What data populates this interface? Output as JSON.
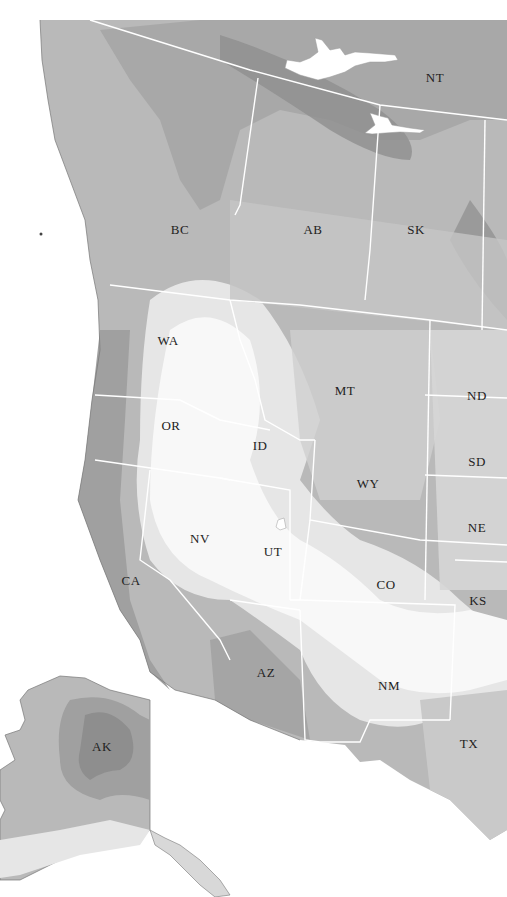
{
  "map": {
    "type": "choropleth-grayscale",
    "region": "Western North America",
    "colors": {
      "background": "#ffffff",
      "level_darkest": "#8e8e8e",
      "level_dark": "#a2a2a2",
      "level_mid": "#b9b9b9",
      "level_light": "#d2d2d2",
      "level_lighter": "#e6e6e6",
      "level_lightest": "#f7f7f7",
      "border": "#ffffff",
      "coast": "#777777"
    },
    "labels": [
      {
        "id": "NT",
        "text": "NT",
        "x": 435,
        "y": 78
      },
      {
        "id": "BC",
        "text": "BC",
        "x": 180,
        "y": 230
      },
      {
        "id": "AB",
        "text": "AB",
        "x": 313,
        "y": 230
      },
      {
        "id": "SK",
        "text": "SK",
        "x": 416,
        "y": 230
      },
      {
        "id": "WA",
        "text": "WA",
        "x": 168,
        "y": 341
      },
      {
        "id": "MT",
        "text": "MT",
        "x": 345,
        "y": 391
      },
      {
        "id": "ND",
        "text": "ND",
        "x": 477,
        "y": 396
      },
      {
        "id": "OR",
        "text": "OR",
        "x": 171,
        "y": 426
      },
      {
        "id": "ID",
        "text": "ID",
        "x": 260,
        "y": 446
      },
      {
        "id": "SD",
        "text": "SD",
        "x": 477,
        "y": 462
      },
      {
        "id": "WY",
        "text": "WY",
        "x": 368,
        "y": 484
      },
      {
        "id": "NE",
        "text": "NE",
        "x": 477,
        "y": 528
      },
      {
        "id": "NV",
        "text": "NV",
        "x": 200,
        "y": 539
      },
      {
        "id": "UT",
        "text": "UT",
        "x": 273,
        "y": 552
      },
      {
        "id": "CA",
        "text": "CA",
        "x": 131,
        "y": 581
      },
      {
        "id": "CO",
        "text": "CO",
        "x": 386,
        "y": 585
      },
      {
        "id": "KS",
        "text": "KS",
        "x": 478,
        "y": 601
      },
      {
        "id": "AZ",
        "text": "AZ",
        "x": 266,
        "y": 673
      },
      {
        "id": "NM",
        "text": "NM",
        "x": 389,
        "y": 686
      },
      {
        "id": "AK",
        "text": "AK",
        "x": 102,
        "y": 747
      },
      {
        "id": "TX",
        "text": "TX",
        "x": 469,
        "y": 744
      }
    ]
  }
}
